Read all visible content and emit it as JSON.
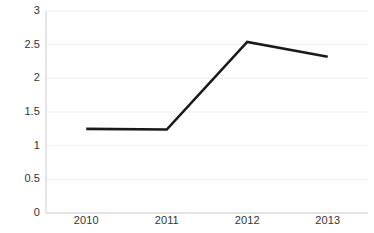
{
  "chart_data": {
    "type": "line",
    "title": "",
    "subtitle": "",
    "xlabel": "",
    "ylabel": "",
    "categories": [
      "2010",
      "2011",
      "2012",
      "2013"
    ],
    "x": [
      2010,
      2011,
      2012,
      2013
    ],
    "values": [
      1.25,
      1.24,
      2.54,
      2.32
    ],
    "series": [
      {
        "name": "",
        "values": [
          1.25,
          1.24,
          2.54,
          2.32
        ]
      }
    ],
    "ylim": [
      0,
      3
    ],
    "y_ticks": [
      0,
      0.5,
      1,
      1.5,
      2,
      2.5,
      3
    ],
    "y_tick_labels": [
      "0",
      "0.5",
      "1",
      "1.5",
      "2",
      "2.5",
      "3"
    ],
    "x_tick_labels": [
      "2010",
      "2011",
      "2012",
      "2013"
    ],
    "grid": true,
    "grid_axis": "y",
    "legend": false,
    "legend_position": "none",
    "markers": false,
    "annotations": []
  },
  "style": {
    "line_color": "#1a1a1a",
    "grid_color": "#eeeeee",
    "axis_color": "#cccccc",
    "background_color": "#ffffff",
    "tick_label_color": "#333333"
  },
  "geometry": {
    "plot_left": 46,
    "plot_right": 368,
    "plot_top": 11,
    "plot_bottom": 213
  }
}
